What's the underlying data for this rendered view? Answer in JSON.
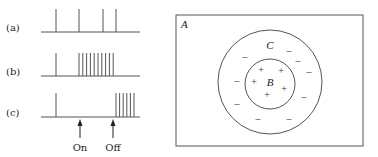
{
  "left_panel": {
    "rows": [
      {
        "label": "(a)",
        "baseline_y": 32,
        "spike_top": 9,
        "spikes_x": [
          56,
          79,
          103,
          116
        ]
      },
      {
        "label": "(b)",
        "baseline_y": 76,
        "spike_top": 53,
        "spikes_x": [
          56,
          79,
          82.8,
          86.6,
          90.4,
          94.2,
          98,
          101.8,
          105.6,
          109.4,
          113.2
        ]
      },
      {
        "label": "(c)",
        "baseline_y": 117,
        "spike_top": 93,
        "spikes_x": [
          56,
          116,
          119.6,
          123.2,
          126.8,
          130.4,
          134
        ]
      }
    ],
    "baseline_x_start": 41,
    "baseline_x_end": 140,
    "markers": [
      {
        "label": "On",
        "x": 80
      },
      {
        "label": "Off",
        "x": 113
      }
    ]
  },
  "right_panel": {
    "region_label_outer": "A",
    "region_label_ring": "C",
    "region_label_inner": "B",
    "rect": {
      "x": 176,
      "y": 15,
      "w": 187,
      "h": 131
    },
    "outer_circle": {
      "cx": 270,
      "cy": 82,
      "r": 52
    },
    "inner_circle": {
      "cx": 270,
      "cy": 84,
      "r": 25
    },
    "minus_signs": [
      [
        245,
        57
      ],
      [
        289,
        51
      ],
      [
        298,
        61
      ],
      [
        309,
        72
      ],
      [
        237,
        81
      ],
      [
        304,
        97
      ],
      [
        237,
        104
      ],
      [
        258,
        119
      ],
      [
        289,
        119
      ]
    ],
    "plus_signs": [
      [
        261,
        70
      ],
      [
        281,
        71
      ],
      [
        254,
        82
      ],
      [
        284,
        89
      ],
      [
        267,
        95
      ]
    ],
    "minus_glyph": "–",
    "plus_glyph": "+"
  }
}
